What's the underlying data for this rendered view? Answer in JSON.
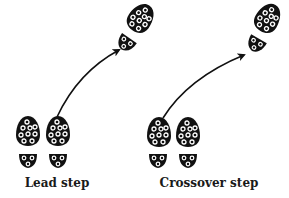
{
  "colors": {
    "ink": "#111111",
    "background": "#ffffff",
    "cleat": "#ffffff"
  },
  "panels": [
    {
      "id": "lead",
      "label": "Lead step",
      "label_pos": {
        "x": 57,
        "y": 176
      },
      "prints": [
        {
          "role": "left-foot-start",
          "sole": {
            "cx": 28,
            "cy": 131,
            "rot": 0
          },
          "heel": {
            "cx": 28,
            "cy": 160,
            "rot": 0
          }
        },
        {
          "role": "right-foot-start",
          "sole": {
            "cx": 58,
            "cy": 131,
            "rot": 0
          },
          "heel": {
            "cx": 58,
            "cy": 160,
            "rot": 0
          }
        },
        {
          "role": "right-foot-end",
          "sole": {
            "cx": 141,
            "cy": 18,
            "rot": 35
          },
          "heel": {
            "cx": 126,
            "cy": 43,
            "rot": 35
          }
        }
      ],
      "arrow": {
        "path": "M 57 117 Q 78 72 119 50"
      }
    },
    {
      "id": "crossover",
      "label": "Crossover step",
      "label_pos": {
        "x": 209,
        "y": 176
      },
      "prints": [
        {
          "role": "left-foot-start",
          "sole": {
            "cx": 159,
            "cy": 132,
            "rot": 0
          },
          "heel": {
            "cx": 158,
            "cy": 160,
            "rot": 0
          }
        },
        {
          "role": "right-foot-start",
          "sole": {
            "cx": 188,
            "cy": 132,
            "rot": 0
          },
          "heel": {
            "cx": 188,
            "cy": 160,
            "rot": 0
          }
        },
        {
          "role": "left-foot-end",
          "sole": {
            "cx": 268,
            "cy": 18,
            "rot": 30
          },
          "heel": {
            "cx": 256,
            "cy": 44,
            "rot": 30
          }
        }
      ],
      "arrow": {
        "path": "M 163 118 Q 188 78 244 55"
      }
    }
  ]
}
